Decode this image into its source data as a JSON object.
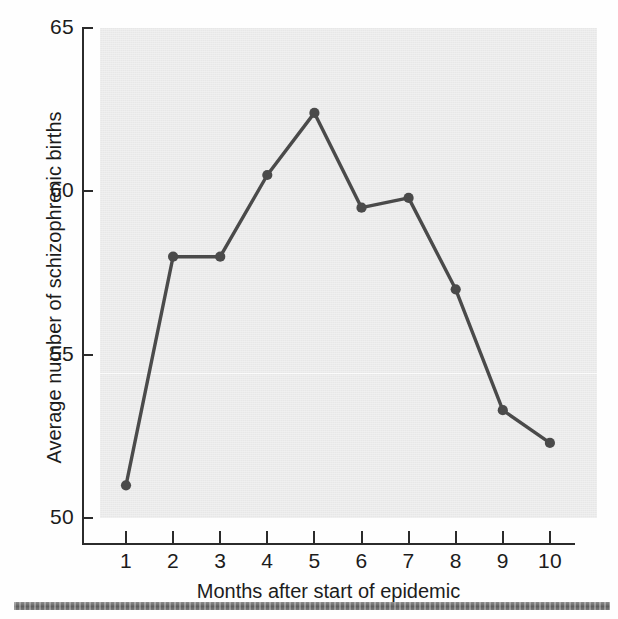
{
  "chart_data": {
    "type": "line",
    "title": "",
    "xlabel": "Months after start of epidemic",
    "ylabel": "Average number of schizophrenic births",
    "x": [
      1,
      2,
      3,
      4,
      5,
      6,
      7,
      8,
      9,
      10
    ],
    "values": [
      51.0,
      58.0,
      58.0,
      60.5,
      62.4,
      59.5,
      59.8,
      57.0,
      53.3,
      52.3
    ],
    "xtick_labels": [
      "1",
      "2",
      "3",
      "4",
      "5",
      "6",
      "7",
      "8",
      "9",
      "10"
    ],
    "ytick_labels": [
      "50",
      "55",
      "60",
      "65"
    ],
    "ytick_values": [
      50,
      55,
      60,
      65
    ],
    "xlim": [
      0.5,
      10.5
    ],
    "ylim": [
      50,
      65
    ],
    "grid": false,
    "legend": false,
    "marker": "filled-circle",
    "series_color": "#4a4a4a",
    "plot_background_color": "#e7e7e7",
    "axis_color": "#2b2b2b",
    "figure_background_color": "#ffffff"
  },
  "axes": {
    "x_title": "Months after start of epidemic",
    "y_title": "Average number of schizophrenic births"
  },
  "footer": {
    "rule_color": "#6f6f6f"
  }
}
